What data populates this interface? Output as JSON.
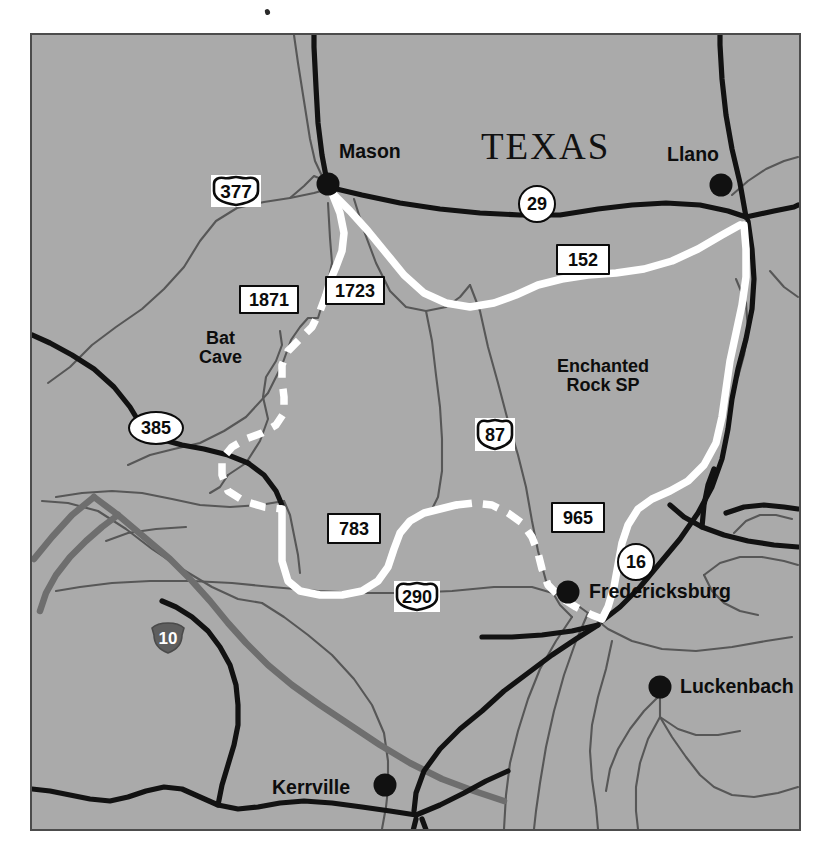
{
  "map": {
    "state_label": "TEXAS",
    "background_color": "#a6a6a6",
    "frame_color": "#4c4c4c",
    "cities": [
      {
        "name": "Mason",
        "dot_x": 326,
        "dot_y": 182,
        "label_x": 338,
        "label_y": 143,
        "anchor": "end"
      },
      {
        "name": "Llano",
        "dot_x": 719,
        "dot_y": 183,
        "label_x": 711,
        "label_y": 146,
        "anchor": "end"
      },
      {
        "name": "Fredericksburg",
        "dot_x": 566,
        "dot_y": 590,
        "label_x": 588,
        "label_y": 585,
        "anchor": "start"
      },
      {
        "name": "Luckenbach",
        "dot_x": 658,
        "dot_y": 685,
        "label_x": 678,
        "label_y": 675,
        "anchor": "start"
      },
      {
        "name": "Kerrville",
        "dot_x": 383,
        "dot_y": 783,
        "label_x": 370,
        "label_y": 786,
        "anchor": "end"
      }
    ],
    "places": [
      {
        "name": "Bat\nCave",
        "x": 228,
        "y": 327
      },
      {
        "name": "Enchanted\nRock SP",
        "x": 615,
        "y": 358
      }
    ],
    "shields": [
      {
        "number": "377",
        "type": "us-shield",
        "x": 213,
        "y": 172,
        "w": 48,
        "h": 30
      },
      {
        "number": "1871",
        "type": "rectangle",
        "x": 235,
        "y": 262,
        "w": 54,
        "h": 24
      },
      {
        "number": "1723",
        "type": "rectangle",
        "x": 321,
        "y": 253,
        "w": 54,
        "h": 24
      },
      {
        "number": "385",
        "type": "oval",
        "x": 150,
        "y": 391,
        "w": 50,
        "h": 29
      },
      {
        "number": "29",
        "type": "circle",
        "x": 533,
        "y": 194,
        "w": 33,
        "h": 33
      },
      {
        "number": "152",
        "type": "rectangle",
        "x": 577,
        "y": 228,
        "w": 48,
        "h": 26
      },
      {
        "number": "87",
        "type": "us-shield",
        "x": 490,
        "y": 430,
        "w": 38,
        "h": 31
      },
      {
        "number": "965",
        "type": "rectangle",
        "x": 573,
        "y": 490,
        "w": 48,
        "h": 26
      },
      {
        "number": "16",
        "type": "circle",
        "x": 632,
        "y": 538,
        "w": 33,
        "h": 33
      },
      {
        "number": "783",
        "type": "rectangle",
        "x": 349,
        "y": 501,
        "w": 48,
        "h": 26
      },
      {
        "number": "290",
        "type": "us-shield",
        "x": 414,
        "y": 578,
        "w": 44,
        "h": 30
      },
      {
        "number": "10",
        "type": "interstate",
        "x": 164,
        "y": 615,
        "w": 36,
        "h": 32
      }
    ],
    "legend_notes": {
      "interstate_color": "#6e6e6e",
      "us_highway_color": "#1a1a1a",
      "scenic_route_color": "#ffffff",
      "minor_road_color": "#4d4d4d"
    }
  }
}
